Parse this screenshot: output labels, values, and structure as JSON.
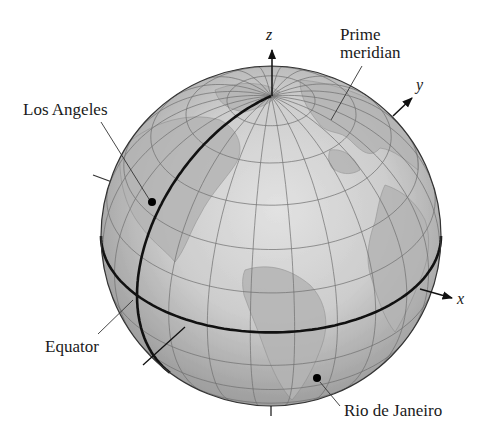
{
  "figure": {
    "type": "globe-diagram"
  },
  "labels": {
    "los_angeles": "Los Angeles",
    "prime_meridian_line1": "Prime",
    "prime_meridian_line2": "meridian",
    "equator": "Equator",
    "rio": "Rio de Janeiro"
  },
  "axes": {
    "x": "x",
    "y": "y",
    "z": "z"
  },
  "colors": {
    "globe_center": "#dcdcdc",
    "globe_edge": "#9c9c9c",
    "graticule": "#6e6e6e",
    "land": "#b8b8b8",
    "heavy_line": "#111111",
    "text": "#1a1a1a"
  },
  "globe": {
    "cx": 271,
    "cy": 236,
    "r": 170,
    "tilt_deg": 34.6,
    "rotation_deg": -52
  },
  "points": [
    {
      "name": "Los Angeles",
      "x": 152,
      "y": 202
    },
    {
      "name": "Rio de Janeiro",
      "x": 317,
      "y": 378
    }
  ]
}
